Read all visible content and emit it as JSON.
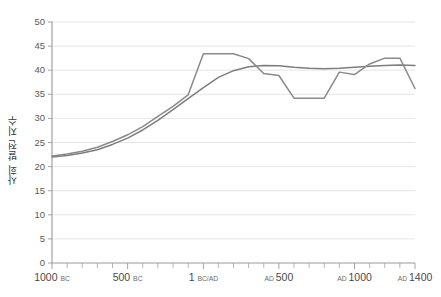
{
  "chart_data": {
    "type": "line",
    "title": "",
    "xlabel": "",
    "ylabel": "사회 발전 지수",
    "ylim": [
      0,
      50
    ],
    "xlim": [
      -1000,
      1400
    ],
    "y_ticks": [
      0,
      5,
      10,
      15,
      20,
      25,
      30,
      35,
      40,
      45,
      50
    ],
    "x_ticks": [
      -1000,
      -900,
      -800,
      -700,
      -600,
      -500,
      -400,
      -300,
      -200,
      -100,
      1,
      100,
      200,
      300,
      400,
      500,
      600,
      700,
      800,
      900,
      1000,
      1100,
      1200,
      1300,
      1400
    ],
    "x_tick_labels": [
      {
        "value": -1000,
        "number": "1000",
        "era": "BC"
      },
      {
        "value": -500,
        "number": "500",
        "era": "BC"
      },
      {
        "value": 1,
        "number": "1",
        "era": "BC/AD"
      },
      {
        "value": 500,
        "number": "500",
        "era": "AD",
        "era_first": true
      },
      {
        "value": 1000,
        "number": "1000",
        "era": "AD",
        "era_first": true
      },
      {
        "value": 1400,
        "number": "1400",
        "era": "AD",
        "era_first": true
      }
    ],
    "grid": "horizontal",
    "legend": "none",
    "series": [
      {
        "name": "서양 사회 발전 지수",
        "color": "#7d7d7d",
        "width": 1.5,
        "x": [
          -1000,
          -900,
          -800,
          -700,
          -600,
          -500,
          -400,
          -300,
          -200,
          -100,
          1,
          100,
          200,
          300,
          400,
          500,
          600,
          700,
          800,
          900,
          1000,
          1100,
          1200,
          1300,
          1400
        ],
        "values": [
          22.0,
          22.3,
          22.8,
          23.5,
          24.6,
          25.9,
          27.6,
          29.6,
          31.8,
          34.1,
          36.4,
          38.5,
          39.9,
          40.7,
          41.0,
          40.9,
          40.6,
          40.4,
          40.3,
          40.4,
          40.6,
          40.8,
          41.0,
          41.1,
          41.0
        ]
      },
      {
        "name": "동양 사회 발전 지수",
        "color": "#8a8a8a",
        "width": 1.5,
        "x": [
          -1000,
          -900,
          -800,
          -700,
          -600,
          -500,
          -400,
          -300,
          -200,
          -100,
          1,
          100,
          200,
          300,
          400,
          500,
          600,
          700,
          800,
          900,
          1000,
          1100,
          1200,
          1300,
          1400
        ],
        "values": [
          22.2,
          22.6,
          23.2,
          24.0,
          25.2,
          26.6,
          28.3,
          30.4,
          32.5,
          34.9,
          43.4,
          43.4,
          43.4,
          42.4,
          39.3,
          38.9,
          34.2,
          34.2,
          34.2,
          39.6,
          39.1,
          41.3,
          42.5,
          42.5,
          36.2
        ]
      }
    ]
  },
  "plot_geometry": {
    "left": 52,
    "right": 415,
    "top": 22,
    "bottom": 263
  }
}
